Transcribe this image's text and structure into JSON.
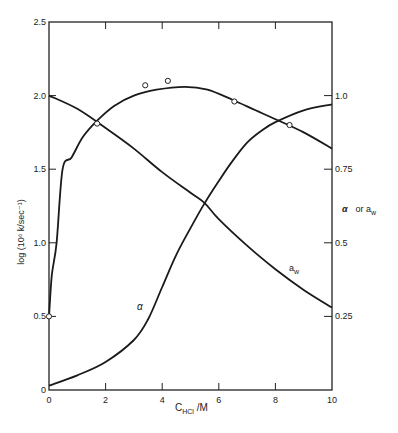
{
  "chart_data": {
    "type": "line",
    "title": "",
    "xlabel_main": "C",
    "xlabel_sub": "HCl",
    "xlabel_unit": " /M",
    "ylabel_left": "log (10⁶ k/sec⁻¹)",
    "ylabel_right_alpha": "α",
    "ylabel_right_or": "or a",
    "ylabel_right_sub": "w",
    "xlim": [
      0,
      10
    ],
    "ylim_left": [
      0,
      2.5
    ],
    "ylim_right": [
      0,
      1.25
    ],
    "x_ticks": [
      "0",
      "2",
      "4",
      "6",
      "8",
      "10"
    ],
    "y_left_ticks": [
      "0",
      "0.5",
      "1.0",
      "1.5",
      "2.0",
      "2.5"
    ],
    "y_right_ticks": [
      "0.25",
      "0.5",
      "0.75",
      "1.0"
    ],
    "grid": false,
    "legend": "inline labels",
    "series": [
      {
        "name": "log (10⁶ k/sec⁻¹)",
        "axis": "left",
        "label": "",
        "x": [
          0,
          0.1,
          0.27,
          0.48,
          0.8,
          1.2,
          1.7,
          2.3,
          3.0,
          3.8,
          4.8,
          5.6,
          6.5,
          7.3,
          8.0,
          9.0,
          10.0
        ],
        "y": [
          0.5,
          0.78,
          1.0,
          1.5,
          1.58,
          1.72,
          1.83,
          1.93,
          2.0,
          2.04,
          2.06,
          2.04,
          1.97,
          1.9,
          1.84,
          1.75,
          1.64
        ]
      },
      {
        "name": "log k data points",
        "axis": "left",
        "type": "scatter",
        "x": [
          0.0,
          1.7,
          3.4,
          4.2,
          6.55,
          8.5
        ],
        "y": [
          0.5,
          1.81,
          2.07,
          2.1,
          1.96,
          1.8
        ]
      },
      {
        "name": "alpha",
        "axis": "right",
        "label": "α",
        "x": [
          0,
          1,
          2,
          3,
          3.5,
          4,
          4.5,
          5,
          5.5,
          6,
          6.5,
          7,
          7.5,
          8,
          9,
          10
        ],
        "y": [
          0.015,
          0.05,
          0.095,
          0.17,
          0.24,
          0.35,
          0.46,
          0.55,
          0.635,
          0.71,
          0.78,
          0.84,
          0.88,
          0.91,
          0.95,
          0.97
        ]
      },
      {
        "name": "a_w",
        "axis": "right",
        "label": "a",
        "label_sub": "w",
        "x": [
          0,
          1,
          2,
          3,
          4,
          5,
          5.5,
          6,
          7,
          8,
          9,
          10
        ],
        "y": [
          1.0,
          0.955,
          0.89,
          0.82,
          0.74,
          0.67,
          0.635,
          0.58,
          0.49,
          0.41,
          0.34,
          0.28
        ]
      }
    ]
  }
}
